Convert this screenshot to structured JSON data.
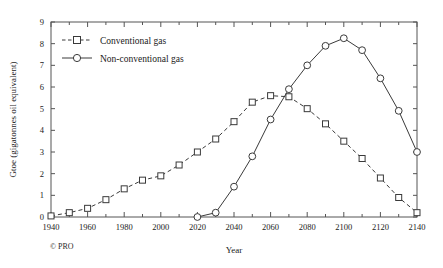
{
  "chart_data": {
    "type": "line",
    "title": "",
    "xlabel": "Year",
    "ylabel": "Gtoe (gigatonnes oil equivalent)",
    "xlim": [
      1940,
      2140
    ],
    "ylim": [
      0,
      9
    ],
    "xticks": [
      1940,
      1960,
      1980,
      2000,
      2020,
      2040,
      2060,
      2080,
      2100,
      2120,
      2140
    ],
    "xtick_labels": [
      "1940",
      "1960",
      "1980",
      "2000",
      "2020",
      "2040",
      "2060",
      "2080",
      "2100",
      "2120",
      "2140"
    ],
    "xminor_step": 10,
    "yticks": [
      0,
      1,
      2,
      3,
      4,
      5,
      6,
      7,
      8,
      9
    ],
    "ytick_labels": [
      "0",
      "1",
      "2",
      "3",
      "4",
      "5",
      "6",
      "7",
      "8",
      "9"
    ],
    "grid": false,
    "legend_position": "top-left",
    "series": [
      {
        "name": "Conventional gas",
        "style": "dashed",
        "marker": "square",
        "x": [
          1940,
          1950,
          1960,
          1970,
          1980,
          1990,
          2000,
          2010,
          2020,
          2030,
          2040,
          2050,
          2060,
          2070,
          2080,
          2090,
          2100,
          2110,
          2120,
          2130,
          2140
        ],
        "values": [
          0.05,
          0.2,
          0.4,
          0.8,
          1.3,
          1.7,
          1.9,
          2.4,
          3.0,
          3.6,
          4.4,
          5.3,
          5.6,
          5.55,
          5.0,
          4.3,
          3.5,
          2.7,
          1.8,
          0.9,
          0.2
        ]
      },
      {
        "name": "Non-conventional gas",
        "style": "solid",
        "marker": "circle",
        "x": [
          2020,
          2030,
          2040,
          2050,
          2060,
          2070,
          2080,
          2090,
          2100,
          2110,
          2120,
          2130,
          2140
        ],
        "values": [
          0.0,
          0.2,
          1.4,
          2.8,
          4.5,
          5.9,
          7.0,
          7.9,
          8.25,
          7.7,
          6.4,
          4.9,
          3.0
        ]
      }
    ],
    "credit": "© PRO",
    "colors": {
      "line": "#3a3a3a",
      "axis": "#555555",
      "text": "#1a1a1a",
      "background": "#ffffff"
    }
  },
  "legend": {
    "items": [
      {
        "label": "Conventional gas"
      },
      {
        "label": "Non-conventional gas"
      }
    ]
  }
}
